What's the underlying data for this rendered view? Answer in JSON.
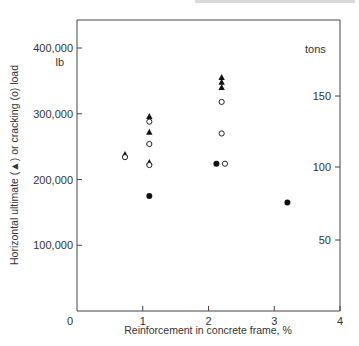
{
  "chart_data": {
    "type": "scatter",
    "title": "",
    "xlabel": "Reinforcement in concrete frame, %",
    "ylabel": "Horizontal ultimate (▲) or cracking (o) load",
    "y_unit_left": "lb",
    "y_unit_right": "tons",
    "xlim": [
      0,
      4
    ],
    "ylim": [
      0,
      400000
    ],
    "x_ticks": [
      "1",
      "2",
      "3",
      "4"
    ],
    "x_origin_label": "0",
    "y_ticks_left": [
      "100,000",
      "200,000",
      "300,000",
      "400,000"
    ],
    "y_ticks_right": [
      "50",
      "100",
      "150"
    ],
    "grid": false,
    "legend": "inline in y-axis label: filled triangle = ultimate load, open circle = cracking load, filled circle = other",
    "series": [
      {
        "name": "Horizontal ultimate load",
        "marker": "filled-triangle",
        "points": [
          {
            "x": 0.73,
            "y": 238000
          },
          {
            "x": 1.1,
            "y": 296000
          },
          {
            "x": 1.1,
            "y": 272000
          },
          {
            "x": 1.1,
            "y": 226000
          },
          {
            "x": 2.2,
            "y": 355000
          },
          {
            "x": 2.2,
            "y": 348000
          },
          {
            "x": 2.2,
            "y": 340000
          }
        ]
      },
      {
        "name": "Cracking load",
        "marker": "open-circle",
        "points": [
          {
            "x": 0.73,
            "y": 234000
          },
          {
            "x": 1.1,
            "y": 288000
          },
          {
            "x": 1.1,
            "y": 254000
          },
          {
            "x": 1.1,
            "y": 222000
          },
          {
            "x": 2.2,
            "y": 318000
          },
          {
            "x": 2.2,
            "y": 270000
          },
          {
            "x": 2.25,
            "y": 224000
          }
        ]
      },
      {
        "name": "Filled circle",
        "marker": "filled-circle",
        "points": [
          {
            "x": 1.1,
            "y": 175000
          },
          {
            "x": 2.12,
            "y": 224000
          },
          {
            "x": 3.2,
            "y": 165000
          }
        ]
      }
    ]
  }
}
